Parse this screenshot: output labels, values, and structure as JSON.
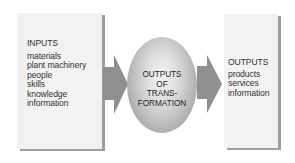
{
  "inputs": {
    "title": "INPUTS",
    "items": [
      "materials",
      "plant machinery",
      "people",
      "skills",
      "knowledge",
      "information"
    ]
  },
  "transformation": {
    "lines": [
      "OUTPUTS",
      "OF",
      "TRANS-",
      "FORMATION"
    ]
  },
  "outputs": {
    "title": "OUTPUTS",
    "items": [
      "products",
      "services",
      "information"
    ]
  },
  "colors": {
    "box_fill": "#f2f2f2",
    "box_shadow": "#9e9e9e",
    "arrow": "#8f8f8f",
    "text": "#333333"
  }
}
